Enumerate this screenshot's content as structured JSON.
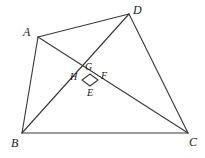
{
  "figure": {
    "kind": "euclidean-geometry-diagram",
    "canvas": {
      "width": 205,
      "height": 158,
      "background": "#ffffff"
    },
    "stroke_color": "#3b3b3b",
    "label_color": "#1a1a1a",
    "vertices": [
      {
        "name": "A",
        "label": "A",
        "x": 38,
        "y": 37,
        "label_x": 23,
        "label_y": 26
      },
      {
        "name": "B",
        "label": "B",
        "x": 22,
        "y": 133,
        "label_x": 11,
        "label_y": 137
      },
      {
        "name": "C",
        "label": "C",
        "x": 188,
        "y": 133,
        "label_x": 189,
        "label_y": 136
      },
      {
        "name": "D",
        "label": "D",
        "x": 129,
        "y": 14,
        "label_x": 133,
        "label_y": 4
      }
    ],
    "inner_points": [
      {
        "name": "G",
        "label": "G",
        "x": 90,
        "y": 74,
        "label_x": 85,
        "label_y": 62
      },
      {
        "name": "F",
        "label": "F",
        "x": 98,
        "y": 80,
        "label_x": 101,
        "label_y": 71
      },
      {
        "name": "E",
        "label": "E",
        "x": 90,
        "y": 86,
        "label_x": 87,
        "label_y": 88
      },
      {
        "name": "H",
        "label": "H",
        "x": 82,
        "y": 80,
        "label_x": 70,
        "label_y": 72
      }
    ],
    "segments": [
      {
        "name": "AB",
        "from": "A",
        "to": "B"
      },
      {
        "name": "BC",
        "from": "B",
        "to": "C"
      },
      {
        "name": "CD",
        "from": "C",
        "to": "D"
      },
      {
        "name": "DA",
        "from": "D",
        "to": "A"
      },
      {
        "name": "AC",
        "from": "A",
        "to": "C"
      },
      {
        "name": "BD",
        "from": "B",
        "to": "D"
      }
    ],
    "inner_segments": [
      {
        "name": "HG",
        "from": "H",
        "to": "G"
      },
      {
        "name": "GF",
        "from": "G",
        "to": "F"
      },
      {
        "name": "FE",
        "from": "F",
        "to": "E"
      },
      {
        "name": "EH",
        "from": "E",
        "to": "H"
      }
    ],
    "notes": {
      "right_angle_at": "G",
      "description": "Quadrilateral ABCD with diagonals AC and BD intersecting; small quadrilateral EFGH (right angle marked at G) drawn at the intersection."
    }
  }
}
